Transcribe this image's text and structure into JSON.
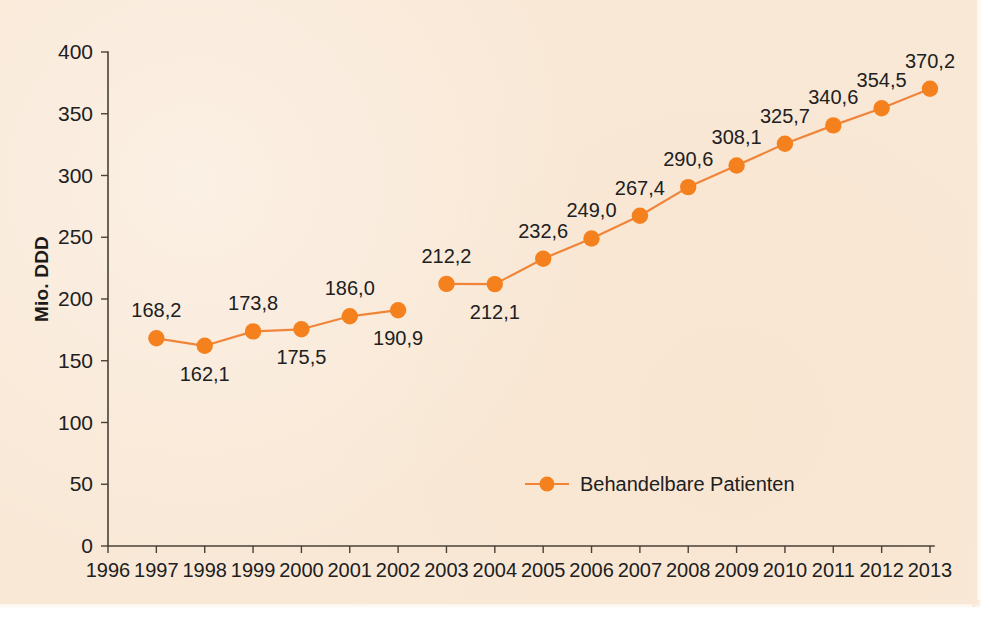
{
  "chart_data": {
    "type": "line",
    "title": "",
    "subtitle": "",
    "xlabel": "",
    "ylabel": "Mio. DDD",
    "xlim": [
      1996,
      2013
    ],
    "ylim": [
      0,
      400
    ],
    "ytick_step": 50,
    "grid": false,
    "legend_position": "bottom-center",
    "categories": [
      1996,
      1997,
      1998,
      1999,
      2000,
      2001,
      2002,
      2003,
      2004,
      2005,
      2006,
      2007,
      2008,
      2009,
      2010,
      2011,
      2012,
      2013
    ],
    "xticklabels": [
      "1996",
      "1997",
      "1998",
      "1999",
      "2000",
      "2001",
      "2002",
      "2003",
      "2004",
      "2005",
      "2006",
      "2007",
      "2008",
      "2009",
      "2010",
      "2011",
      "2012",
      "2013"
    ],
    "yticklabels": [
      "0",
      "50",
      "100",
      "150",
      "200",
      "250",
      "300",
      "350",
      "400"
    ],
    "yticks": [
      0,
      50,
      100,
      150,
      200,
      250,
      300,
      350,
      400
    ],
    "series": [
      {
        "name": "Behandelbare Patienten",
        "color": "#f5811e",
        "line_color": "#f0853a",
        "x": [
          1997,
          1998,
          1999,
          2000,
          2001,
          2002,
          2003,
          2004,
          2005,
          2006,
          2007,
          2008,
          2009,
          2010,
          2011,
          2012,
          2013
        ],
        "values": [
          168.2,
          162.1,
          173.8,
          175.5,
          186.0,
          190.9,
          212.2,
          212.1,
          232.6,
          249.0,
          267.4,
          290.6,
          308.1,
          325.7,
          340.6,
          354.5,
          370.2
        ],
        "data_labels": [
          "168,2",
          "162,1",
          "173,8",
          "175,5",
          "186,0",
          "190,9",
          "212,2",
          "212,1",
          "232,6",
          "249,0",
          "267,4",
          "290,6",
          "308,1",
          "325,7",
          "340,6",
          "354,5",
          "370,2"
        ],
        "label_positions": [
          "above",
          "below",
          "above",
          "below",
          "above",
          "below",
          "above",
          "below",
          "above",
          "above",
          "above",
          "above",
          "above",
          "above",
          "above",
          "above",
          "above"
        ],
        "line_break_after": 2002
      }
    ]
  },
  "legend": {
    "entries": [
      {
        "label": "Behandelbare Patienten",
        "color": "#f5811e"
      }
    ]
  },
  "colors": {
    "background": "#f9e8d6",
    "accent": "#f5811e",
    "axis": "#4a4137",
    "text": "#20201e"
  }
}
